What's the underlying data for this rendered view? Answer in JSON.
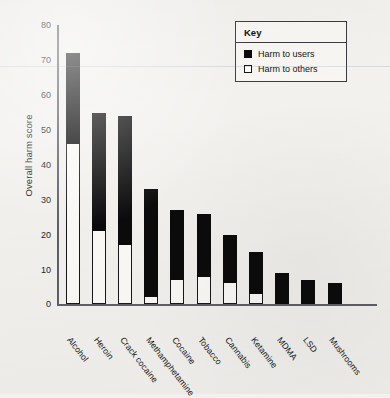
{
  "chart_data": {
    "type": "bar",
    "subtype": "stacked-bar",
    "title": "",
    "xlabel": "",
    "ylabel": "Overall harm score",
    "ylim": [
      0,
      80
    ],
    "yticks": [
      0,
      10,
      20,
      30,
      40,
      50,
      60,
      70,
      80
    ],
    "ytick_labels": [
      "0",
      "10",
      "20",
      "30",
      "40",
      "50",
      "60",
      "70",
      "80"
    ],
    "grid": false,
    "categories": [
      "Alcohol",
      "Heroin",
      "Crack cocaine",
      "Methamphetamine",
      "Cocaine",
      "Tobacco",
      "Cannabis",
      "Ketamine",
      "MDMA",
      "LSD",
      "Mushrooms"
    ],
    "series": [
      {
        "name": "Harm to users",
        "color": "#0b0b0b",
        "values": [
          26,
          34,
          37,
          31,
          20,
          18,
          14,
          12,
          9,
          7,
          6
        ]
      },
      {
        "name": "Harm to others",
        "color": "#ffffff",
        "values": [
          46,
          21,
          17,
          2,
          7,
          8,
          6,
          3,
          0,
          0,
          0
        ]
      }
    ],
    "totals": [
      72,
      55,
      54,
      33,
      27,
      26,
      20,
      15,
      9,
      7,
      6
    ],
    "legend_position": "top-right"
  },
  "legend": {
    "title": "Key",
    "items": [
      {
        "label": "Harm to users",
        "swatch": "filled"
      },
      {
        "label": "Harm to others",
        "swatch": "hollow"
      }
    ]
  }
}
